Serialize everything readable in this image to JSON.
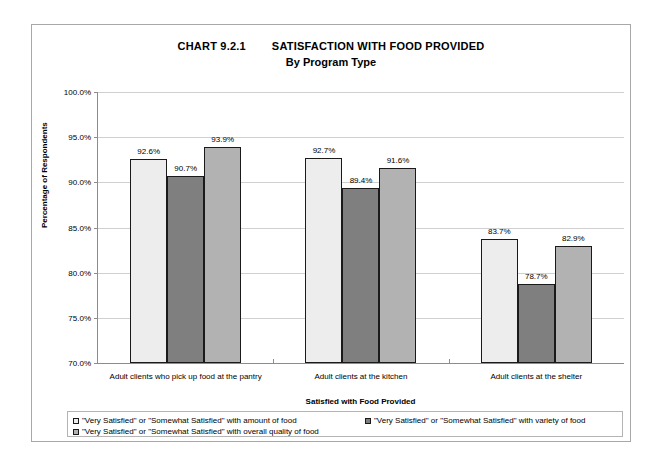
{
  "chart_data": {
    "type": "bar",
    "title": "CHART 9.2.1        SATISFACTION WITH FOOD PROVIDED",
    "subtitle": "By Program Type",
    "xlabel": "Satisfied with Food Provided",
    "ylabel": "Percentage of Respondents",
    "ylim": [
      70.0,
      100.0
    ],
    "ytick_labels": [
      "100.0%",
      "95.0%",
      "90.0%",
      "85.0%",
      "80.0%",
      "75.0%",
      "70.0%"
    ],
    "ytick_values": [
      100.0,
      95.0,
      90.0,
      85.0,
      80.0,
      75.0,
      70.0
    ],
    "grid": true,
    "legend_position": "bottom",
    "categories": [
      "Adult clients who pick up food at the pantry",
      "Adult clients at the kitchen",
      "Adult clients at the shelter"
    ],
    "series": [
      {
        "name": "\"Very Satisfied\" or \"Somewhat Satisfied\" with amount of food",
        "color": "#ededed",
        "values": [
          92.6,
          92.7,
          83.7
        ],
        "labels": [
          "92.6%",
          "92.7%",
          "83.7%"
        ]
      },
      {
        "name": "\"Very Satisfied\" or \"Somewhat Satisfied\" with variety of food",
        "color": "#7f7f7f",
        "values": [
          90.7,
          89.4,
          78.7
        ],
        "labels": [
          "90.7%",
          "89.4%",
          "78.7%"
        ]
      },
      {
        "name": "\"Very Satisfied\" or \"Somewhat Satisfied\" with overall quality of food",
        "color": "#b2b2b2",
        "values": [
          93.9,
          91.6,
          82.9
        ],
        "labels": [
          "93.9%",
          "91.6%",
          "82.9%"
        ]
      }
    ]
  }
}
